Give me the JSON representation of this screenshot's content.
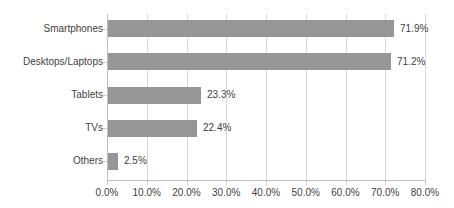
{
  "chart_data": {
    "type": "bar",
    "orientation": "horizontal",
    "title": "",
    "subtitle": "",
    "xlabel": "",
    "ylabel": "",
    "categories": [
      "Smartphones",
      "Desktops/Laptops",
      "Tablets",
      "TVs",
      "Others"
    ],
    "values": [
      71.9,
      71.2,
      23.3,
      22.4,
      2.5
    ],
    "data_labels": [
      "71.9%",
      "71.2%",
      "23.3%",
      "22.4%",
      "2.5%"
    ],
    "series": [
      {
        "name": "Share",
        "values": [
          71.9,
          71.2,
          23.3,
          22.4,
          2.5
        ]
      }
    ],
    "xlim": [
      0,
      80
    ],
    "xtick_values": [
      0,
      10,
      20,
      30,
      40,
      50,
      60,
      70,
      80
    ],
    "xtick_labels": [
      "0.0%",
      "10.0%",
      "20.0%",
      "30.0%",
      "40.0%",
      "50.0%",
      "60.0%",
      "70.0%",
      "80.0%"
    ],
    "grid": true,
    "grid_axis": "x",
    "legend": false,
    "legend_position": "none",
    "annotations": []
  },
  "style": {
    "bar_color": "#969696",
    "grid_color": "#d9d9d9",
    "axis_color": "#bfbfbf",
    "text_color": "#3f3f3f",
    "background": "#ffffff"
  }
}
